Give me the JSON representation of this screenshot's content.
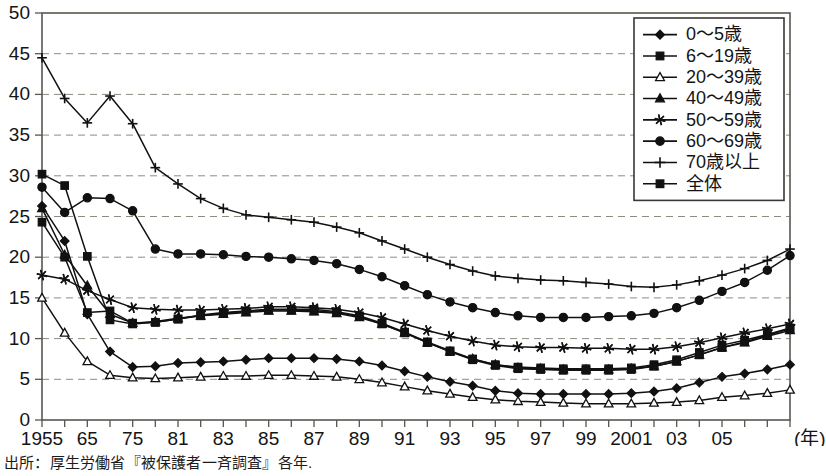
{
  "chart_data": {
    "type": "line",
    "title": "",
    "xlabel": "年",
    "ylabel": "",
    "ylim": [
      0,
      50
    ],
    "ytick_values": [
      0,
      5,
      10,
      15,
      20,
      25,
      30,
      35,
      40,
      45,
      50
    ],
    "ytick_labels": [
      "0",
      "5",
      "10",
      "15",
      "20",
      "25",
      "30",
      "35",
      "40",
      "45",
      "50"
    ],
    "grid": "horizontal-dashed",
    "legend_position": "top-right",
    "x": [
      1955,
      1960,
      1965,
      1970,
      1971,
      1973,
      1975,
      1977,
      1979,
      1981,
      1982,
      1983,
      1984,
      1985,
      1986,
      1987,
      1988,
      1989,
      1990,
      1991,
      1992,
      1993,
      1994,
      1995,
      1996,
      1997,
      1998,
      1999,
      2000,
      2001,
      2002,
      2003,
      2004,
      2005
    ],
    "xtick_labels": [
      "1955",
      "",
      "65",
      "",
      "75",
      "",
      "81",
      "",
      "83",
      "",
      "85",
      "",
      "87",
      "",
      "89",
      "",
      "91",
      "",
      "93",
      "",
      "95",
      "",
      "97",
      "",
      "99",
      "",
      "2001",
      "",
      "03",
      "",
      "05"
    ],
    "xtick_display": [
      {
        "label": "1955",
        "index": 0
      },
      {
        "label": "65",
        "index": 2
      },
      {
        "label": "75",
        "index": 4
      },
      {
        "label": "81",
        "index": 6
      },
      {
        "label": "83",
        "index": 8
      },
      {
        "label": "85",
        "index": 10
      },
      {
        "label": "87",
        "index": 12
      },
      {
        "label": "89",
        "index": 14
      },
      {
        "label": "91",
        "index": 16
      },
      {
        "label": "93",
        "index": 18
      },
      {
        "label": "95",
        "index": 20
      },
      {
        "label": "97",
        "index": 22
      },
      {
        "label": "99",
        "index": 24
      },
      {
        "label": "2001",
        "index": 26
      },
      {
        "label": "03",
        "index": 28
      },
      {
        "label": "05",
        "index": 30
      }
    ],
    "series": [
      {
        "name": "0〜5歳",
        "marker": "diamond",
        "fill": "solid",
        "values": [
          26.3,
          22.0,
          13.0,
          8.4,
          6.5,
          6.6,
          7.0,
          7.1,
          7.2,
          7.4,
          7.6,
          7.6,
          7.6,
          7.5,
          7.2,
          6.7,
          6.0,
          5.3,
          4.7,
          4.2,
          3.6,
          3.3,
          3.2,
          3.2,
          3.2,
          3.2,
          3.3,
          3.5,
          3.9,
          4.6,
          5.3,
          5.7,
          6.2,
          6.8
        ]
      },
      {
        "name": "6〜19歳",
        "marker": "square",
        "fill": "solid",
        "values": [
          24.3,
          20.0,
          13.2,
          13.4,
          11.9,
          12.0,
          12.4,
          12.9,
          13.2,
          13.4,
          13.6,
          13.6,
          13.6,
          13.3,
          12.8,
          11.9,
          10.8,
          9.6,
          8.5,
          7.5,
          6.8,
          6.5,
          6.4,
          6.3,
          6.3,
          6.3,
          6.4,
          6.8,
          7.4,
          8.3,
          9.2,
          9.8,
          10.5,
          11.3
        ]
      },
      {
        "name": "20〜39歳",
        "marker": "triangle",
        "fill": "open",
        "values": [
          15.0,
          10.7,
          7.2,
          5.5,
          5.2,
          5.1,
          5.2,
          5.3,
          5.4,
          5.4,
          5.5,
          5.5,
          5.4,
          5.3,
          5.0,
          4.6,
          4.1,
          3.6,
          3.2,
          2.8,
          2.5,
          2.3,
          2.2,
          2.1,
          2.0,
          2.0,
          2.0,
          2.1,
          2.2,
          2.4,
          2.8,
          3.0,
          3.3,
          3.7
        ]
      },
      {
        "name": "40〜49歳",
        "marker": "triangle",
        "fill": "solid",
        "values": [
          26.0,
          20.3,
          16.5,
          13.0,
          11.9,
          12.1,
          12.5,
          12.8,
          13.0,
          13.2,
          13.4,
          13.4,
          13.3,
          13.1,
          12.6,
          11.8,
          10.7,
          9.5,
          8.4,
          7.5,
          6.8,
          6.4,
          6.3,
          6.2,
          6.2,
          6.2,
          6.3,
          6.6,
          7.2,
          8.0,
          8.9,
          9.5,
          10.3,
          11.0
        ]
      },
      {
        "name": "50〜59歳",
        "marker": "star",
        "fill": "solid",
        "values": [
          17.8,
          17.3,
          15.9,
          14.8,
          13.8,
          13.6,
          13.5,
          13.5,
          13.6,
          13.7,
          13.9,
          13.9,
          13.8,
          13.6,
          13.2,
          12.6,
          11.8,
          11.0,
          10.3,
          9.7,
          9.2,
          9.0,
          8.9,
          8.9,
          8.8,
          8.8,
          8.7,
          8.7,
          9.0,
          9.5,
          10.1,
          10.7,
          11.2,
          11.8
        ]
      },
      {
        "name": "60〜69歳",
        "marker": "circle",
        "fill": "solid",
        "values": [
          28.6,
          25.5,
          27.3,
          27.2,
          25.7,
          21.0,
          20.4,
          20.4,
          20.3,
          20.1,
          20.0,
          19.8,
          19.6,
          19.2,
          18.5,
          17.6,
          16.5,
          15.4,
          14.5,
          13.8,
          13.2,
          12.8,
          12.6,
          12.6,
          12.6,
          12.7,
          12.8,
          13.1,
          13.8,
          14.7,
          15.8,
          16.9,
          18.4,
          20.2
        ]
      },
      {
        "name": "70歳以上",
        "marker": "plus",
        "fill": "none",
        "values": [
          44.5,
          39.5,
          36.5,
          39.8,
          36.4,
          31.0,
          29.0,
          27.2,
          26.0,
          25.2,
          24.9,
          24.6,
          24.3,
          23.7,
          23.0,
          22.0,
          21.0,
          20.0,
          19.1,
          18.3,
          17.7,
          17.4,
          17.2,
          17.1,
          16.9,
          16.7,
          16.4,
          16.3,
          16.6,
          17.1,
          17.8,
          18.6,
          19.6,
          21.0
        ]
      },
      {
        "name": "全体",
        "marker": "square",
        "fill": "solid",
        "values": [
          30.2,
          28.8,
          20.1,
          12.3,
          11.8,
          12.0,
          12.4,
          12.8,
          13.1,
          13.3,
          13.5,
          13.5,
          13.4,
          13.2,
          12.7,
          11.8,
          10.7,
          9.5,
          8.4,
          7.4,
          6.7,
          6.3,
          6.2,
          6.1,
          6.1,
          6.1,
          6.2,
          6.6,
          7.2,
          8.0,
          8.9,
          9.6,
          10.4,
          11.2
        ]
      }
    ]
  },
  "legend": {
    "items": [
      {
        "label": "0〜5歳",
        "marker": "diamond"
      },
      {
        "label": "6〜19歳",
        "marker": "square"
      },
      {
        "label": "20〜39歳",
        "marker": "triangle-open"
      },
      {
        "label": "40〜49歳",
        "marker": "triangle"
      },
      {
        "label": "50〜59歳",
        "marker": "star"
      },
      {
        "label": "60〜69歳",
        "marker": "circle"
      },
      {
        "label": "70歳以上",
        "marker": "plus"
      },
      {
        "label": "全体",
        "marker": "square"
      }
    ]
  },
  "axis": {
    "x_unit_label": "(年)"
  },
  "footer": {
    "source": "出所：厚生労働省『被保護者一斉調査』各年."
  }
}
